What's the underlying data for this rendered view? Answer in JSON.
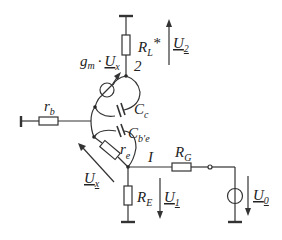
{
  "diagram": {
    "type": "small-signal equivalent circuit",
    "labels": {
      "load_resistor": {
        "main": "R",
        "sub": "L",
        "suffix": "*"
      },
      "output_voltage": {
        "main": "U",
        "sub": "2"
      },
      "node_2": "2",
      "transconductance": {
        "g": "g",
        "g_sub": "m",
        "dot": "·",
        "u": "U",
        "u_sub": "x"
      },
      "base_resistor": {
        "main": "r",
        "sub": "b"
      },
      "collector_cap": {
        "main": "C",
        "sub": "c"
      },
      "be_cap": {
        "main": "C",
        "sub": "b'e"
      },
      "emitter_resistor": {
        "main": "r",
        "sub": "e"
      },
      "control_voltage": {
        "main": "U",
        "sub": "x"
      },
      "current": "I",
      "generator_resistor": {
        "main": "R",
        "sub": "G"
      },
      "emitter_resistor_ext": {
        "main": "R",
        "sub": "E"
      },
      "input_voltage": {
        "main": "U",
        "sub": "1"
      },
      "source_voltage": {
        "main": "U",
        "sub": "0"
      }
    }
  }
}
